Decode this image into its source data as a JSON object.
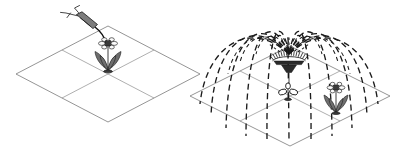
{
  "figure": {
    "background_color": "#ffffff",
    "width": 400,
    "height": 153,
    "line_color": "#7a7a7a",
    "accent_color": "#1c1c1c",
    "foliage_color": "#6f6f6f"
  },
  "panels": [
    {
      "id": "left",
      "name": "targeted-watering-panel",
      "caption": "",
      "ground": {
        "name": "isometric-plot-left",
        "shape": "isometric-rhombus",
        "cells": 4,
        "rows": 2,
        "columns": 2,
        "center_x": 108,
        "center_y": 74,
        "half_width": 92,
        "half_height": 48
      },
      "objects": [
        {
          "name": "watering-can",
          "label": "hand sprayer",
          "x": 82,
          "y": 22
        },
        {
          "name": "water-stream",
          "label": "directed water stream",
          "from_x": 96,
          "from_y": 26,
          "to_x": 107,
          "to_y": 44
        },
        {
          "name": "flower-plant-left",
          "label": "single watered plant",
          "x": 108,
          "y": 52,
          "leaf_count": 4,
          "petal_count": 6
        }
      ]
    },
    {
      "id": "right",
      "name": "sprinkler-irrigation-panel",
      "caption": "",
      "ground": {
        "name": "isometric-plot-right",
        "shape": "isometric-rhombus",
        "cells": 4,
        "rows": 2,
        "columns": 2,
        "center_x": 290,
        "center_y": 96,
        "half_width": 100,
        "half_height": 50
      },
      "objects": [
        {
          "name": "sprinkler-head",
          "label": "rotary sprinkler",
          "x": 289,
          "y": 58,
          "nozzle_count": 18
        },
        {
          "name": "spray-dome",
          "label": "water spray dome",
          "arc_count": 12,
          "dash_pattern": "5 4",
          "apex_y": 14,
          "radius_x": 92,
          "radius_y": 70
        },
        {
          "name": "seedling-plant-right",
          "label": "young seedling",
          "x": 288,
          "y": 92
        },
        {
          "name": "flower-plant-right",
          "label": "flowering plant",
          "x": 336,
          "y": 95,
          "leaf_count": 4,
          "petal_count": 6
        }
      ]
    }
  ],
  "legend": {
    "items": [
      {
        "name": "solid-line",
        "label": "plot boundary",
        "style": "solid",
        "color": "#7a7a7a"
      },
      {
        "name": "dashed-line",
        "label": "water spray path",
        "style": "dashed",
        "color": "#1c1c1c"
      }
    ]
  }
}
